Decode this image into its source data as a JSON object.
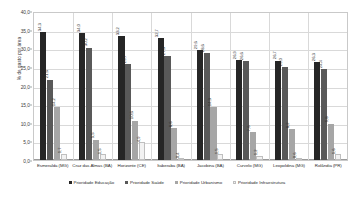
{
  "chart_data": {
    "type": "bar",
    "title": "",
    "subtitle": "",
    "xlabel": "",
    "ylabel": "% de gasto por área",
    "ylim": [
      0.0,
      40.0
    ],
    "ytick_step": 5.0,
    "ytick_labels": [
      "0,0",
      "5,0",
      "10,0",
      "15,0",
      "20,0",
      "25,0",
      "30,0",
      "35,0",
      "40,0"
    ],
    "ytick_values": [
      0.0,
      5.0,
      10.0,
      15.0,
      20.0,
      25.0,
      30.0,
      35.0,
      40.0
    ],
    "grid": true,
    "legend_position": "bottom",
    "grouped": true,
    "value_labels_rotated": true,
    "categories": [
      "Esmeralda (MG)",
      "Cruz das Almas (BA)",
      "Horizonte (CE)",
      "Itaberaba (BA)",
      "Jacobina (BA)",
      "Curvelo (MG)",
      "Leopoldina (MG)",
      "Rolândia (PR)"
    ],
    "series": [
      {
        "name": "Prioridade Educação",
        "color": "#262626",
        "values": [
          34.3,
          34.0,
          33.2,
          32.7,
          29.6,
          26.9,
          26.7,
          26.3
        ],
        "labels": [
          "34,3",
          "34,0",
          "33,2",
          "32,7",
          "29,6",
          "26,9",
          "26,7",
          "26,3"
        ]
      },
      {
        "name": "Prioridade Saúde",
        "color": "#595959",
        "values": [
          21.6,
          30.2,
          25.7,
          27.8,
          28.6,
          26.6,
          25.0,
          24.4
        ],
        "labels": [
          "21,6",
          "30,2",
          "25,7",
          "27,8",
          "28,6",
          "26,6",
          "25,0",
          "24,4"
        ]
      },
      {
        "name": "Prioridade Urbanismo",
        "color": "#a6a6a6",
        "values": [
          14.2,
          5.5,
          10.6,
          8.6,
          14.3,
          7.6,
          8.2,
          9.8
        ],
        "labels": [
          "14,2",
          "5,5",
          "10,6",
          "8,6",
          "14,3",
          "7,6",
          "8,2",
          "9,8"
        ]
      },
      {
        "name": "Prioridade Infraestrutura",
        "color": "#f2f2f2",
        "values": [
          1.7,
          1.5,
          4.9,
          0.4,
          1.5,
          1.2,
          0.6,
          1.6
        ],
        "labels": [
          "1,7",
          "1,5",
          "4,9",
          "0,4",
          "1,5",
          "1,2",
          "0,6",
          "1,6"
        ]
      }
    ]
  }
}
